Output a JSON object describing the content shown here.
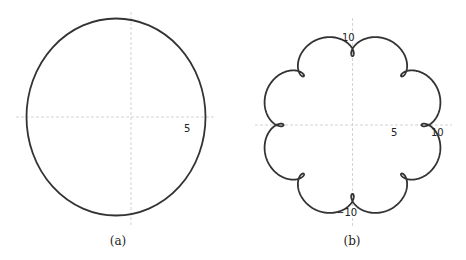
{
  "chart_data": [
    {
      "type": "line",
      "panel": "a",
      "caption": "(a)",
      "description": "Closed near-circular curve centered near origin",
      "shape": {
        "kind": "ellipse",
        "cx": -0.9,
        "cy": 0,
        "rx": 6.1,
        "ry": 6.7
      },
      "tick_labels": [
        {
          "text": "5",
          "x": 5,
          "y": 0
        }
      ],
      "grid": false,
      "axes": "dashed light gray through origin"
    },
    {
      "type": "line",
      "panel": "b",
      "caption": "(b)",
      "description": "Rosette curve with 8 outer lobes and 8 inward loops",
      "parametric": {
        "A": 9.6,
        "B": 1.4,
        "n": 9,
        "formula": "z(t)=A·e^{it} − B·e^{i·n·t}"
      },
      "tick_labels": [
        {
          "text": "5",
          "x": 5,
          "y": 0
        },
        {
          "text": "10",
          "x": 10,
          "y": 0
        },
        {
          "text": "10",
          "x": 0,
          "y": 10
        },
        {
          "text": "−10",
          "x": 0,
          "y": -10
        }
      ],
      "grid": false,
      "axes": "dashed light gray through origin"
    }
  ],
  "panels": {
    "a": {
      "caption": "(a)",
      "tick5": "5"
    },
    "b": {
      "caption": "(b)",
      "tick5": "5",
      "tick10x": "10",
      "tick10y": "10",
      "tickm10y": "−10"
    }
  },
  "style": {
    "curve_color": "#333333",
    "axis_color": "#c8c8c8"
  }
}
